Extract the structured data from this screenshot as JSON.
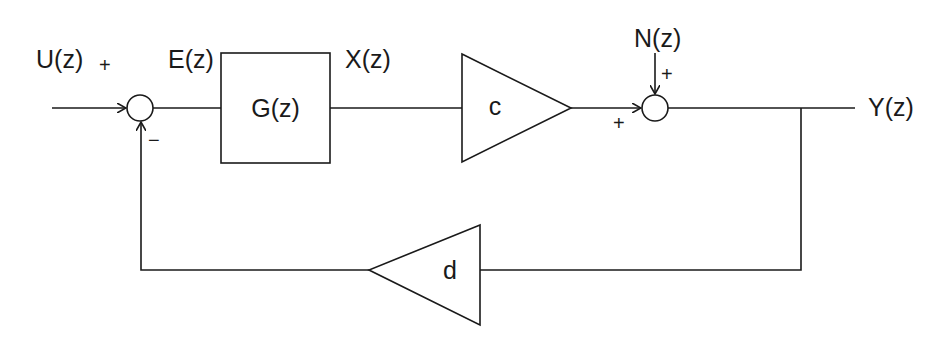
{
  "diagram": {
    "type": "feedback block diagram",
    "signals": {
      "input": "U(z)",
      "error": "E(z)",
      "intermediate": "X(z)",
      "noise": "N(z)",
      "output": "Y(z)"
    },
    "blocks": {
      "plant": "G(z)",
      "forward_gain": "c",
      "feedback_gain": "d"
    },
    "summer1_signs": {
      "input": "+",
      "feedback": "−"
    },
    "summer2_signs": {
      "forward": "+",
      "noise": "+"
    },
    "line_color": "#1a1a1a"
  }
}
